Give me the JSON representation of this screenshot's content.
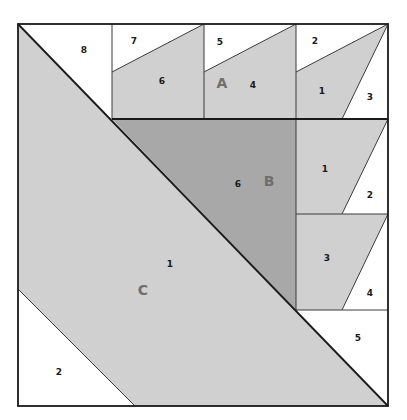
{
  "diagram": {
    "type": "quilt-block-paper-piecing",
    "colors": {
      "light_fabric": "#d0d0d0",
      "dark_fabric": "#a8a8a8",
      "background": "#ffffff",
      "line": "#1a1a1a",
      "section_letter": "#6e6e6e"
    },
    "sections": [
      {
        "letter": "A"
      },
      {
        "letter": "B"
      },
      {
        "letter": "C"
      }
    ],
    "labels": {
      "top_row": [
        "8",
        "7",
        "6",
        "5",
        "4",
        "2",
        "1",
        "3"
      ],
      "right_col": [
        "1",
        "2",
        "3",
        "4",
        "5"
      ],
      "center": "6",
      "big": [
        "1",
        "2"
      ]
    }
  }
}
